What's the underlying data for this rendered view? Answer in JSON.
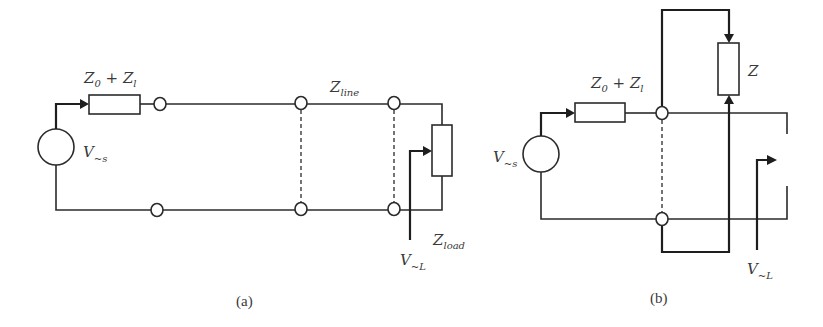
{
  "figure": {
    "panel_a": {
      "caption": "(a)",
      "source_label": {
        "main": "V",
        "sub": "~s"
      },
      "series_impedance_label": {
        "z0": "Z",
        "z0_sub": "0",
        "plus": " + ",
        "zl": "Z",
        "zl_sub": "l"
      },
      "line_label": {
        "main": "Z",
        "sub": "line"
      },
      "load_label": {
        "main": "Z",
        "sub": "load"
      },
      "load_voltage_label": {
        "main": "V",
        "sub": "~L"
      }
    },
    "panel_b": {
      "caption": "(b)",
      "source_label": {
        "main": "V",
        "sub": "~s"
      },
      "series_impedance_label": {
        "z0": "Z",
        "z0_sub": "0",
        "plus": " + ",
        "zl": "Z",
        "zl_sub": "l"
      },
      "impedance_label": {
        "main": "Z"
      },
      "load_voltage_label": {
        "main": "V",
        "sub": "~L"
      }
    },
    "colors": {
      "line": "#2b2b2b",
      "text": "#3a3a3a",
      "background": "#ffffff"
    }
  }
}
